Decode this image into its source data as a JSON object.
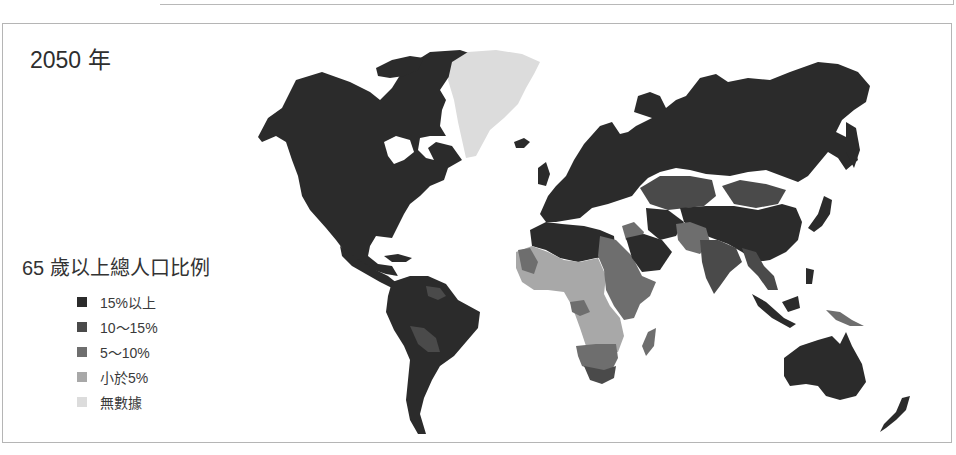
{
  "header": {
    "title": "2050 年"
  },
  "legend": {
    "title": "65 歲以上總人口比例",
    "items": [
      {
        "label": "15%以上",
        "color": "#2b2b2b"
      },
      {
        "label": "10～15%",
        "color": "#4a4a4a"
      },
      {
        "label": "5～10%",
        "color": "#6e6e6e"
      },
      {
        "label": "小於5%",
        "color": "#a8a8a8"
      },
      {
        "label": "無數據",
        "color": "#dcdcdc"
      }
    ]
  },
  "map": {
    "type": "choropleth world map",
    "regions": [
      {
        "name": "North America",
        "category": "15%以上"
      },
      {
        "name": "Greenland",
        "category": "無數據"
      },
      {
        "name": "South America",
        "category": "15%以上"
      },
      {
        "name": "Bolivia",
        "category": "10～15%"
      },
      {
        "name": "Guyana region",
        "category": "10～15%"
      },
      {
        "name": "Europe",
        "category": "15%以上"
      },
      {
        "name": "Russia",
        "category": "15%以上"
      },
      {
        "name": "North Africa",
        "category": "15%以上"
      },
      {
        "name": "West/Central Africa",
        "category": "小於5%"
      },
      {
        "name": "East Africa (Sudan/Ethiopia)",
        "category": "5～10%"
      },
      {
        "name": "Southern Africa",
        "category": "5～10%"
      },
      {
        "name": "South Africa",
        "category": "10～15%"
      },
      {
        "name": "Madagascar",
        "category": "5～10%"
      },
      {
        "name": "Kazakhstan",
        "category": "10～15%"
      },
      {
        "name": "Mongolia",
        "category": "10～15%"
      },
      {
        "name": "Middle East (Saudi Arabia)",
        "category": "15%以上"
      },
      {
        "name": "Iraq/Syria",
        "category": "5～10%"
      },
      {
        "name": "Pakistan/Afghanistan",
        "category": "5～10%"
      },
      {
        "name": "India",
        "category": "10～15%"
      },
      {
        "name": "China",
        "category": "15%以上"
      },
      {
        "name": "Southeast Asia",
        "category": "10～15%"
      },
      {
        "name": "Indonesia",
        "category": "15%以上"
      },
      {
        "name": "Papua New Guinea",
        "category": "5～10%"
      },
      {
        "name": "Australia",
        "category": "15%以上"
      },
      {
        "name": "New Zealand",
        "category": "15%以上"
      },
      {
        "name": "Japan",
        "category": "15%以上"
      }
    ]
  }
}
